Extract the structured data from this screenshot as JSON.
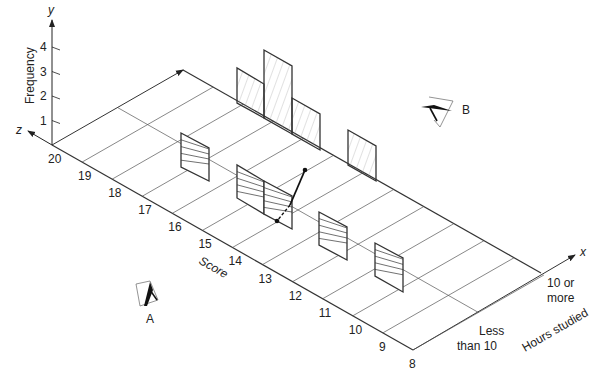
{
  "chart_data": {
    "type": "3d-bar",
    "title": "",
    "axes": {
      "y": {
        "symbol": "y",
        "label": "Frequency",
        "ticks": [
          "1",
          "2",
          "3",
          "4"
        ]
      },
      "z": {
        "symbol": "z",
        "label": "Score",
        "ticks": [
          "20",
          "19",
          "18",
          "17",
          "16",
          "15",
          "14",
          "13",
          "12",
          "11",
          "10",
          "9",
          "8"
        ]
      },
      "x": {
        "symbol": "x",
        "label": "Hours studied",
        "categories": [
          "Less than 10",
          "10 or more"
        ]
      }
    },
    "series": [
      {
        "name": "Less than 10",
        "points": [
          {
            "score": 17,
            "frequency": 1.4
          },
          {
            "score": 15,
            "frequency": 1.4
          },
          {
            "score": 14,
            "frequency": 1.4
          },
          {
            "score": 12,
            "frequency": 1.4
          },
          {
            "score": 10,
            "frequency": 1.4
          }
        ]
      },
      {
        "name": "10 or more",
        "points": [
          {
            "score": 16,
            "frequency": 1.4
          },
          {
            "score": 15,
            "frequency": 2.8
          },
          {
            "score": 14,
            "frequency": 1.4
          },
          {
            "score": 12,
            "frequency": 1.4
          }
        ]
      }
    ],
    "annotations": [
      "A",
      "B"
    ]
  },
  "labels": {
    "y_symbol": "y",
    "z_symbol": "z",
    "x_symbol": "x",
    "frequency": "Frequency",
    "score": "Score",
    "hours_studied": "Hours studied",
    "less_than_10_line1": "Less",
    "less_than_10_line2": "than 10",
    "ten_or_more_line1": "10 or",
    "ten_or_more_line2": "more",
    "viewer_a": "A",
    "viewer_b": "B",
    "y_ticks": [
      "1",
      "2",
      "3",
      "4"
    ],
    "score_ticks": [
      "20",
      "19",
      "18",
      "17",
      "16",
      "15",
      "14",
      "13",
      "12",
      "11",
      "10",
      "9",
      "8"
    ]
  }
}
